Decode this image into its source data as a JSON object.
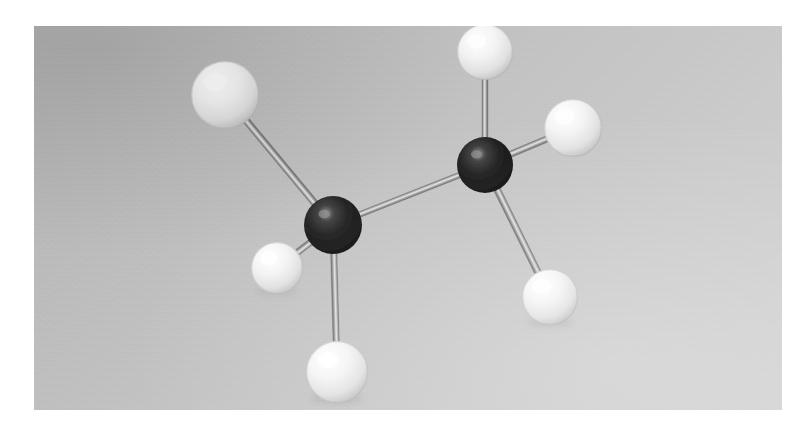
{
  "image": {
    "kind": "photograph",
    "subject": "ball-and-stick molecular model of ethane",
    "formula": "C2H6",
    "plate": {
      "x": 34,
      "y": 26,
      "width": 748,
      "height": 384
    },
    "page_background": "#ffffff",
    "backdrop_color_top_left": "#b3b3b3",
    "backdrop_color_bottom_right": "#d2d2d2"
  },
  "palette": {
    "carbon_sphere": "#1b1b1b",
    "carbon_highlight": "#8d8d8d",
    "hydrogen_sphere": "#f2f2f2",
    "hydrogen_highlight": "#ffffff",
    "hydrogen_shadow": "#b0b0b0",
    "bond_rod": "#9a9a9a",
    "bond_rod_edge": "#6f6f6f",
    "drop_shadow": "#8e8e8e"
  },
  "molecule": {
    "name": "Ethane",
    "formula": "C2H6",
    "atoms": [
      {
        "id": "C1",
        "element": "C",
        "label": "carbon-left",
        "cx": 299,
        "cy": 199,
        "r": 29
      },
      {
        "id": "C2",
        "element": "C",
        "label": "carbon-right",
        "cx": 451,
        "cy": 139,
        "r": 28
      },
      {
        "id": "H1",
        "element": "H",
        "label": "hydrogen-upper-left",
        "cx": 191,
        "cy": 69,
        "r": 34
      },
      {
        "id": "H2",
        "element": "H",
        "label": "hydrogen-mid-left",
        "cx": 243,
        "cy": 242,
        "r": 26
      },
      {
        "id": "H3",
        "element": "H",
        "label": "hydrogen-bottom",
        "cx": 303,
        "cy": 346,
        "r": 31
      },
      {
        "id": "H4",
        "element": "H",
        "label": "hydrogen-top",
        "cx": 451,
        "cy": 26,
        "r": 28
      },
      {
        "id": "H5",
        "element": "H",
        "label": "hydrogen-upper-right",
        "cx": 539,
        "cy": 102,
        "r": 29
      },
      {
        "id": "H6",
        "element": "H",
        "label": "hydrogen-lower-right",
        "cx": 516,
        "cy": 271,
        "r": 28
      }
    ],
    "bonds": [
      {
        "from": "C1",
        "to": "C2",
        "label": "bond-carbon-carbon",
        "width": 5.5
      },
      {
        "from": "C1",
        "to": "H1",
        "label": "bond-c1-h-upper-left",
        "width": 6.5
      },
      {
        "from": "C1",
        "to": "H2",
        "label": "bond-c1-h-mid-left",
        "width": 6.0
      },
      {
        "from": "C1",
        "to": "H3",
        "label": "bond-c1-h-bottom",
        "width": 6.0
      },
      {
        "from": "C2",
        "to": "H4",
        "label": "bond-c2-h-top",
        "width": 5.5
      },
      {
        "from": "C2",
        "to": "H5",
        "label": "bond-c2-h-upper-right",
        "width": 6.0
      },
      {
        "from": "C2",
        "to": "H6",
        "label": "bond-c2-h-lower-right",
        "width": 6.5
      }
    ],
    "shadows": [
      {
        "cx": 303,
        "cy": 372,
        "rx": 26,
        "ry": 6,
        "opacity": 0.28
      },
      {
        "cx": 516,
        "cy": 296,
        "rx": 23,
        "ry": 6,
        "opacity": 0.22
      },
      {
        "cx": 243,
        "cy": 265,
        "rx": 21,
        "ry": 5,
        "opacity": 0.2
      }
    ]
  }
}
